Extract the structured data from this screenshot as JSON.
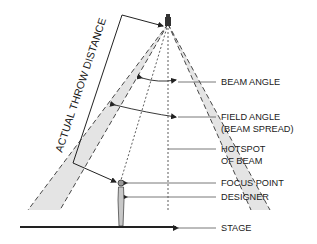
{
  "diagram": {
    "title_rotated": "ACTUAL THROW DISTANCE",
    "labels": [
      {
        "id": "beam-angle",
        "lines": [
          "BEAM ANGLE"
        ]
      },
      {
        "id": "field-angle",
        "lines": [
          "FIELD ANGLE",
          "(BEAM SPREAD)"
        ]
      },
      {
        "id": "hotspot",
        "lines": [
          "HOTSPOT",
          "OF BEAM"
        ]
      },
      {
        "id": "focus-point",
        "lines": [
          "FOCUS POINT"
        ]
      },
      {
        "id": "designer",
        "lines": [
          "DESIGNER"
        ]
      },
      {
        "id": "stage",
        "lines": [
          "STAGE"
        ]
      }
    ],
    "colors": {
      "line": "#2a2a2a",
      "beam_fill": "#e6e6e6",
      "leader": "#555555"
    }
  }
}
